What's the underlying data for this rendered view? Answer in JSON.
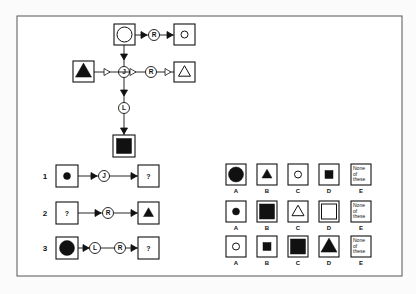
{
  "key_diagram": {
    "top_left": {
      "shape": "circle",
      "fill": "outline",
      "size": "large"
    },
    "top_right": {
      "shape": "circle",
      "fill": "outline",
      "size": "small"
    },
    "left": {
      "shape": "triangle",
      "fill": "solid",
      "size": "large"
    },
    "right": {
      "shape": "triangle",
      "fill": "outline",
      "size": "medium"
    },
    "bottom": {
      "shape": "square",
      "fill": "solid",
      "size": "large"
    },
    "operators": {
      "top_horizontal": "R",
      "center": "J",
      "middle_horizontal": "R",
      "vertical": "L"
    }
  },
  "questions": [
    {
      "number": "1",
      "input": {
        "shape": "circle",
        "fill": "solid",
        "size": "small"
      },
      "operators": [
        "J"
      ],
      "output": "?"
    },
    {
      "number": "2",
      "input": "?",
      "operators": [
        "R"
      ],
      "output": {
        "shape": "triangle",
        "fill": "solid",
        "size": "small"
      }
    },
    {
      "number": "3",
      "input": {
        "shape": "circle",
        "fill": "solid",
        "size": "large"
      },
      "operators": [
        "L",
        "R"
      ],
      "output": "?"
    }
  ],
  "answers": [
    [
      {
        "label": "A",
        "shape": "circle",
        "fill": "solid",
        "size": "large"
      },
      {
        "label": "B",
        "shape": "triangle",
        "fill": "solid",
        "size": "small"
      },
      {
        "label": "C",
        "shape": "circle",
        "fill": "outline",
        "size": "small"
      },
      {
        "label": "D",
        "shape": "square",
        "fill": "solid",
        "size": "small"
      },
      {
        "label": "E",
        "text": [
          "None",
          "of",
          "these"
        ]
      }
    ],
    [
      {
        "label": "A",
        "shape": "circle",
        "fill": "solid",
        "size": "small"
      },
      {
        "label": "B",
        "shape": "square",
        "fill": "solid",
        "size": "large"
      },
      {
        "label": "C",
        "shape": "triangle",
        "fill": "outline",
        "size": "medium"
      },
      {
        "label": "D",
        "shape": "square",
        "fill": "outline",
        "size": "large"
      },
      {
        "label": "E",
        "text": [
          "None",
          "of",
          "these"
        ]
      }
    ],
    [
      {
        "label": "A",
        "shape": "circle",
        "fill": "outline",
        "size": "small"
      },
      {
        "label": "B",
        "shape": "square",
        "fill": "solid",
        "size": "small"
      },
      {
        "label": "C",
        "shape": "square",
        "fill": "solid",
        "size": "large"
      },
      {
        "label": "D",
        "shape": "triangle",
        "fill": "solid",
        "size": "large"
      },
      {
        "label": "E",
        "text": [
          "None",
          "of",
          "these"
        ]
      }
    ]
  ],
  "question_mark": "?"
}
